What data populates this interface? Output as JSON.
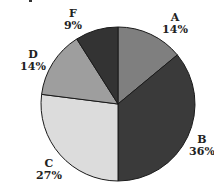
{
  "chart_data": {
    "type": "pie",
    "title": "",
    "start_angle": "12 o'clock, clockwise",
    "categories": [
      "A",
      "B",
      "C",
      "D",
      "F"
    ],
    "values": [
      14,
      36,
      27,
      14,
      9
    ],
    "labels": [
      "14%",
      "36%",
      "27%",
      "14%",
      "9%"
    ],
    "colors": [
      "#7f7f7f",
      "#3a3a3a",
      "#dcdcdc",
      "#9e9e9e",
      "#333333"
    ],
    "legend": "none (labels adjacent to slices)"
  },
  "slice_labels": {
    "A": {
      "name": "A",
      "pct": "14%"
    },
    "B": {
      "name": "B",
      "pct": "36%"
    },
    "C": {
      "name": "C",
      "pct": "27%"
    },
    "D": {
      "name": "D",
      "pct": "14%"
    },
    "F": {
      "name": "F",
      "pct": "9%"
    }
  }
}
